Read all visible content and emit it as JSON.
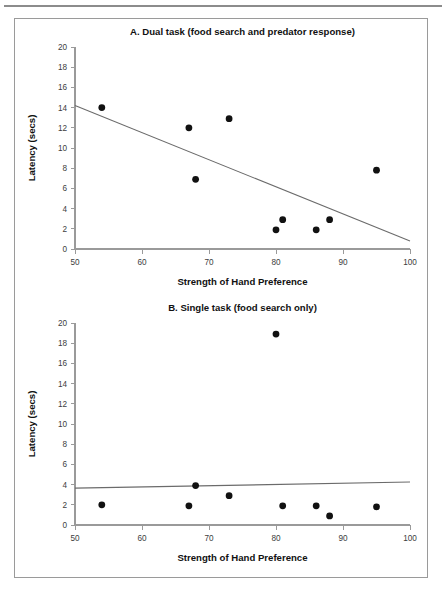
{
  "figure": {
    "background_color": "#ffffff",
    "frame_color": "#9a9a9a",
    "axis_color": "#9a9a9a",
    "marker_color": "#111111",
    "trendline_color": "#6b6b6b"
  },
  "chart_data": [
    {
      "type": "scatter",
      "panel": "A",
      "title": "A. Dual task (food search and predator  response)",
      "xlabel": "Strength of Hand Preference",
      "ylabel": "Latency (secs)",
      "xlim": [
        50,
        100
      ],
      "ylim": [
        0,
        20
      ],
      "xticks": [
        50,
        60,
        70,
        80,
        90,
        100
      ],
      "yticks": [
        0,
        2,
        4,
        6,
        8,
        10,
        12,
        14,
        16,
        18,
        20
      ],
      "grid": false,
      "legend": "none",
      "points": [
        {
          "x": 54,
          "y": 14.0
        },
        {
          "x": 67,
          "y": 12.0
        },
        {
          "x": 68,
          "y": 6.9
        },
        {
          "x": 73,
          "y": 12.9
        },
        {
          "x": 80,
          "y": 1.9
        },
        {
          "x": 81,
          "y": 2.9
        },
        {
          "x": 86,
          "y": 1.9
        },
        {
          "x": 88,
          "y": 2.9
        },
        {
          "x": 95,
          "y": 7.8
        }
      ],
      "trendline": {
        "x0": 50,
        "y0": 14.2,
        "x1": 100,
        "y1": 0.8
      }
    },
    {
      "type": "scatter",
      "panel": "B",
      "title": "B. Single task (food search only)",
      "xlabel": "Strength of Hand Preference",
      "ylabel": "Latency (secs)",
      "xlim": [
        50,
        100
      ],
      "ylim": [
        0,
        20
      ],
      "xticks": [
        50,
        60,
        70,
        80,
        90,
        100
      ],
      "yticks": [
        0,
        2,
        4,
        6,
        8,
        10,
        12,
        14,
        16,
        18,
        20
      ],
      "grid": false,
      "legend": "none",
      "points": [
        {
          "x": 54,
          "y": 2.0
        },
        {
          "x": 67,
          "y": 1.9
        },
        {
          "x": 68,
          "y": 3.9
        },
        {
          "x": 73,
          "y": 2.9
        },
        {
          "x": 80,
          "y": 18.9
        },
        {
          "x": 81,
          "y": 1.9
        },
        {
          "x": 86,
          "y": 1.9
        },
        {
          "x": 88,
          "y": 0.9
        },
        {
          "x": 95,
          "y": 1.8
        }
      ],
      "trendline": {
        "x0": 50,
        "y0": 3.65,
        "x1": 100,
        "y1": 4.25
      }
    }
  ]
}
